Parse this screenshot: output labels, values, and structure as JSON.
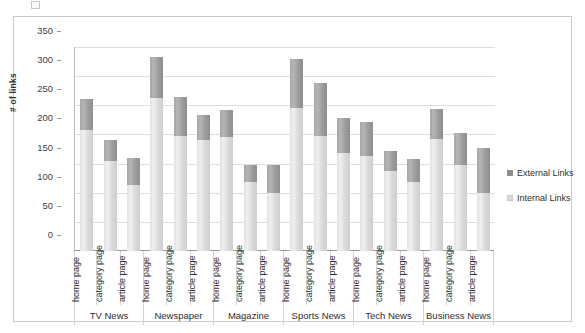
{
  "chart_data": {
    "type": "bar",
    "stacked": true,
    "title": "",
    "xlabel": "",
    "ylabel": "# of links",
    "ylim": [
      0,
      350
    ],
    "ytick_step": 50,
    "yticks": [
      350,
      300,
      250,
      200,
      150,
      100,
      50,
      0
    ],
    "grid": true,
    "legend_position": "right",
    "colors": {
      "external": "#8f8f8f",
      "internal": "#d9d9d9",
      "gridline": "#dddddd",
      "axis": "#9a9a9a",
      "frame": "#c9c9c9",
      "text": "#2e2e2e"
    },
    "group_labels": [
      "TV News",
      "Newspaper",
      "Magazine",
      "Sports News",
      "Tech News",
      "Business News"
    ],
    "page_labels": [
      "home page",
      "category page",
      "article page"
    ],
    "categories": [
      "TV News - home page",
      "TV News - category page",
      "TV News - article page",
      "Newspaper - home page",
      "Newspaper - category page",
      "Newspaper - article page",
      "Magazine - home page",
      "Magazine - category page",
      "Magazine - article page",
      "Sports News - home page",
      "Sports News - category page",
      "Sports News - article page",
      "Tech News - home page",
      "Tech News - category page",
      "Tech News - article page",
      "Business News - home page",
      "Business News - category page",
      "Business News - article page"
    ],
    "series": [
      {
        "name": "Internal Links",
        "values": [
          208,
          155,
          113,
          262,
          198,
          190,
          196,
          118,
          100,
          245,
          198,
          168,
          163,
          138,
          118,
          192,
          148,
          100
        ]
      },
      {
        "name": "External Links",
        "values": [
          52,
          35,
          47,
          70,
          67,
          43,
          46,
          30,
          47,
          85,
          90,
          60,
          59,
          34,
          39,
          51,
          54,
          77
        ]
      }
    ],
    "totals": [
      260,
      190,
      160,
      332,
      265,
      233,
      242,
      148,
      147,
      330,
      288,
      228,
      222,
      172,
      157,
      243,
      202,
      177
    ]
  },
  "legend": {
    "entries": [
      {
        "label": "External Links",
        "swatch": "external"
      },
      {
        "label": "Internal Links",
        "swatch": "internal"
      }
    ]
  }
}
